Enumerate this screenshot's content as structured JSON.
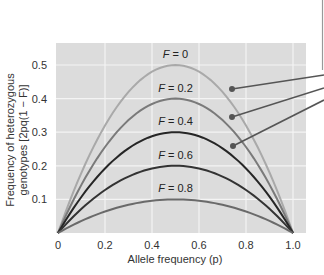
{
  "chart_data": {
    "type": "line",
    "title": "",
    "xlabel": "Allele frequency (p)",
    "ylabel_line1": "Frequency of heterozygous",
    "ylabel_line2": "genotypes [2pq(1 − F)]",
    "xlim": [
      0,
      1.0
    ],
    "ylim": [
      0,
      0.55
    ],
    "grid": true,
    "x_ticks": [
      "0",
      "0.2",
      "0.4",
      "0.6",
      "0.8",
      "1.0"
    ],
    "y_ticks": [
      "0.1",
      "0.2",
      "0.3",
      "0.4",
      "0.5"
    ],
    "series": [
      {
        "name": "F = 0",
        "F": 0,
        "peak": 0.5,
        "color": "#a9a9a9"
      },
      {
        "name": "F = 0.2",
        "F": 0.2,
        "peak": 0.4,
        "color": "#7a7a7a"
      },
      {
        "name": "F = 0.4",
        "F": 0.4,
        "peak": 0.3,
        "color": "#262626"
      },
      {
        "name": "F = 0.6",
        "F": 0.6,
        "peak": 0.2,
        "color": "#333333"
      },
      {
        "name": "F = 0.8",
        "F": 0.8,
        "peak": 0.1,
        "color": "#6a6a6a"
      }
    ],
    "x": [
      0,
      0.1,
      0.2,
      0.3,
      0.4,
      0.5,
      0.6,
      0.7,
      0.8,
      0.9,
      1.0
    ],
    "formula": "2p(1-p)(1-F)",
    "annotations": {
      "callout_lines": 3,
      "callout_targets": [
        "F = 0",
        "F = 0.2",
        "F = 0.4"
      ]
    }
  }
}
